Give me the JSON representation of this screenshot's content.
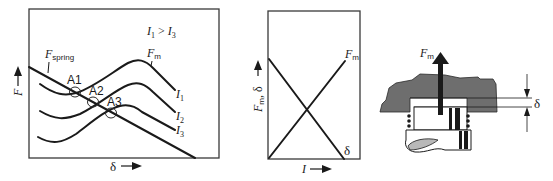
{
  "figure_a": {
    "condition_label": "I1 > I3",
    "condition_parts": {
      "I": "I",
      "one": "1",
      "gt": " > ",
      "three": "3"
    },
    "y_axis_label": "F",
    "x_axis_label": "δ",
    "spring_label": {
      "main": "F",
      "sub": "spring"
    },
    "magnet_label": {
      "main": "F",
      "sub": "m"
    },
    "curve_labels": [
      {
        "main": "I",
        "sub": "1"
      },
      {
        "main": "I",
        "sub": "2"
      },
      {
        "main": "I",
        "sub": "3"
      }
    ],
    "points": [
      "A1",
      "A2",
      "A3"
    ]
  },
  "figure_b": {
    "y_axis_label": {
      "main": "F",
      "sub": "m",
      "rest": ", δ"
    },
    "x_axis_label": "I",
    "line_labels": {
      "fm_main": "F",
      "fm_sub": "m",
      "delta": "δ"
    }
  },
  "figure_c": {
    "force_label": {
      "main": "F",
      "sub": "m"
    },
    "gap_label": "δ"
  },
  "colors": {
    "ink": "#1a1a1a",
    "iron": "#6e6e6e",
    "coil_gray": "#b8b8b8"
  }
}
